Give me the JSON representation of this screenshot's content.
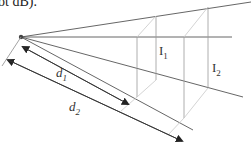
{
  "caption": "ot dB).",
  "labels": {
    "i1": {
      "main": "I",
      "sub": "1"
    },
    "i2": {
      "main": "I",
      "sub": "2"
    },
    "d1": {
      "main": "d",
      "sub": "1"
    },
    "d2": {
      "main": "d",
      "sub": "2"
    }
  },
  "colors": {
    "ray": "#555555",
    "plane": "#9a9a9a",
    "plane_light": "#c8c8c8",
    "arrow": "#333333",
    "source": "#444444"
  }
}
